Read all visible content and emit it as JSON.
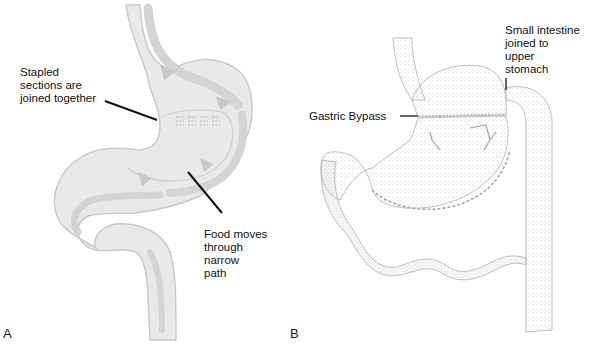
{
  "panels": [
    {
      "id": "A",
      "letter": "A",
      "title": "Stomach stapling (vertical banded gastroplasty)",
      "callouts": [
        {
          "text": "Stapled\nsections are\njoined together"
        },
        {
          "text": "Food moves\nthrough\nnarrow\npath"
        }
      ]
    },
    {
      "id": "B",
      "letter": "B",
      "callouts": [
        {
          "text": "Small intestine\njoined to\nupper\nstomach"
        },
        {
          "text": "Gastric Bypass"
        }
      ]
    }
  ],
  "colors": {
    "organ_fill_a": "#e9e9e9",
    "organ_outline_a": "#c8c8c8",
    "flow_arrow_a": "#d2d2d2",
    "stipple_b": "#bdbdbd",
    "outline_b": "#b0b0b0",
    "leader_line": "#111111"
  }
}
